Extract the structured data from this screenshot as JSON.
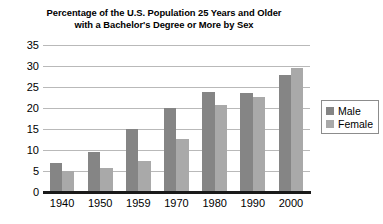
{
  "chart_data": {
    "type": "bar",
    "title": "Percentage of the U.S. Population 25 Years and Older with a Bachelor's Degree or More by Sex",
    "title_lines": [
      "Percentage of the U.S. Population 25 Years and Older",
      "with a Bachelor's Degree or More by Sex"
    ],
    "categories": [
      "1940",
      "1950",
      "1959",
      "1970",
      "1980",
      "1990",
      "2000"
    ],
    "series": [
      {
        "name": "Male",
        "color": "#858585",
        "values": [
          6.9,
          9.6,
          15.0,
          20.0,
          23.9,
          23.6,
          27.8
        ]
      },
      {
        "name": "Female",
        "color": "#a9a9a9",
        "values": [
          4.9,
          5.7,
          7.5,
          12.7,
          20.8,
          22.6,
          29.6
        ]
      }
    ],
    "xlabel": "",
    "ylabel": "",
    "ylim": [
      0,
      35
    ],
    "ytick_step": 5,
    "yticks": [
      "35",
      "30",
      "25",
      "20",
      "15",
      "10",
      "5",
      "0"
    ],
    "grid": true,
    "legend_position": "right",
    "legend_entries": [
      "Male",
      "Female"
    ]
  }
}
